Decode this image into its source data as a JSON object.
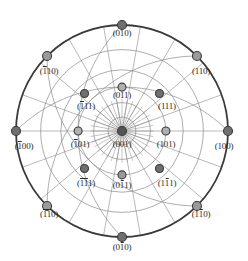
{
  "figure": {
    "type": "stereographic-projection",
    "center_pole": "(001)",
    "primitive_circle_color": "#3a3a3a",
    "net_line_color": "#8a8a8a",
    "pole_outline_color": "#3a3a3a",
    "background_color": "#ffffff",
    "text_color": "#2b2b2b"
  },
  "geometry": {
    "center_x": 122,
    "center_y": 131,
    "radius": 106,
    "net_meridians": 18,
    "net_parallels": 5
  },
  "poles": [
    {
      "id": "010",
      "label_parts": [
        {
          "t": "(0",
          "bar": false
        },
        {
          "t": "1",
          "bar": false
        },
        {
          "t": "0)",
          "bar": false
        }
      ],
      "label_text": "(010)",
      "angle_deg": 90,
      "rho_frac": 1.0,
      "fill": "#6f6f6f",
      "label_x": 122,
      "label_y": 28,
      "size": 9
    },
    {
      "id": "0-10",
      "label_parts": [
        {
          "t": "(0",
          "bar": false
        },
        {
          "t": "1",
          "bar": true
        },
        {
          "t": "0)",
          "bar": false
        }
      ],
      "label_text": "(010)",
      "angle_deg": 270,
      "rho_frac": 1.0,
      "fill": "#6f6f6f",
      "label_x": 122,
      "label_y": 242,
      "size": 9
    },
    {
      "id": "100",
      "label_parts": [
        {
          "t": "(100)",
          "bar": false
        }
      ],
      "label_text": "(100)",
      "angle_deg": 0,
      "rho_frac": 1.0,
      "fill": "#6f6f6f",
      "label_x": 224,
      "label_y": 141,
      "size": 9
    },
    {
      "id": "-100",
      "label_parts": [
        {
          "t": "(",
          "bar": false
        },
        {
          "t": "1",
          "bar": true
        },
        {
          "t": "00)",
          "bar": false
        }
      ],
      "label_text": "(100)",
      "angle_deg": 180,
      "rho_frac": 1.0,
      "fill": "#6f6f6f",
      "label_x": 24,
      "label_y": 141,
      "size": 9
    },
    {
      "id": "110",
      "label_parts": [
        {
          "t": "(110)",
          "bar": false
        }
      ],
      "label_text": "(110)",
      "angle_deg": 45,
      "rho_frac": 1.0,
      "fill": "#9a9a9a",
      "label_x": 201,
      "label_y": 66,
      "size": 9
    },
    {
      "id": "-110",
      "label_parts": [
        {
          "t": "(",
          "bar": false
        },
        {
          "t": "1",
          "bar": true
        },
        {
          "t": "10)",
          "bar": false
        }
      ],
      "label_text": "(110)",
      "angle_deg": 135,
      "rho_frac": 1.0,
      "fill": "#9a9a9a",
      "label_x": 49,
      "label_y": 66,
      "size": 9
    },
    {
      "id": "-1-10",
      "label_parts": [
        {
          "t": "(",
          "bar": false
        },
        {
          "t": "11",
          "bar": true
        },
        {
          "t": "0)",
          "bar": false
        }
      ],
      "label_text": "(110)",
      "angle_deg": 225,
      "rho_frac": 1.0,
      "fill": "#9a9a9a",
      "label_x": 49,
      "label_y": 209,
      "size": 9
    },
    {
      "id": "1-10",
      "label_parts": [
        {
          "t": "(1",
          "bar": false
        },
        {
          "t": "1",
          "bar": true
        },
        {
          "t": "0)",
          "bar": false
        }
      ],
      "label_text": "(110)",
      "angle_deg": 315,
      "rho_frac": 1.0,
      "fill": "#9a9a9a",
      "label_x": 201,
      "label_y": 209,
      "size": 9
    },
    {
      "id": "001",
      "label_parts": [
        {
          "t": "(001)",
          "bar": false
        }
      ],
      "label_text": "(001)",
      "angle_deg": 0,
      "rho_frac": 0.0,
      "fill": "#555555",
      "label_x": 122,
      "label_y": 139,
      "size": 9
    },
    {
      "id": "011",
      "label_parts": [
        {
          "t": "(011)",
          "bar": false
        }
      ],
      "label_text": "(011)",
      "angle_deg": 90,
      "rho_frac": 0.414,
      "fill": "#b0b0b0",
      "label_x": 122,
      "label_y": 90,
      "size": 8
    },
    {
      "id": "0-11",
      "label_parts": [
        {
          "t": "(0",
          "bar": false
        },
        {
          "t": "1",
          "bar": true
        },
        {
          "t": "1)",
          "bar": false
        }
      ],
      "label_text": "(011)",
      "angle_deg": 270,
      "rho_frac": 0.414,
      "fill": "#9a9a9a",
      "label_x": 122,
      "label_y": 180,
      "size": 8
    },
    {
      "id": "101",
      "label_parts": [
        {
          "t": "(101)",
          "bar": false
        }
      ],
      "label_text": "(101)",
      "angle_deg": 0,
      "rho_frac": 0.414,
      "fill": "#b0b0b0",
      "label_x": 166,
      "label_y": 139,
      "size": 8
    },
    {
      "id": "-101",
      "label_parts": [
        {
          "t": "(",
          "bar": false
        },
        {
          "t": "1",
          "bar": true
        },
        {
          "t": "01)",
          "bar": false
        }
      ],
      "label_text": "(101)",
      "angle_deg": 180,
      "rho_frac": 0.414,
      "fill": "#b0b0b0",
      "label_x": 80,
      "label_y": 139,
      "size": 8
    },
    {
      "id": "111",
      "label_parts": [
        {
          "t": "(111)",
          "bar": false
        }
      ],
      "label_text": "(111)",
      "angle_deg": 45,
      "rho_frac": 0.5,
      "fill": "#6f6f6f",
      "label_x": 167,
      "label_y": 101,
      "size": 8
    },
    {
      "id": "-111",
      "label_parts": [
        {
          "t": "(",
          "bar": false
        },
        {
          "t": "1",
          "bar": true
        },
        {
          "t": "11)",
          "bar": false
        }
      ],
      "label_text": "(111)",
      "angle_deg": 135,
      "rho_frac": 0.5,
      "fill": "#6f6f6f",
      "label_x": 86,
      "label_y": 101,
      "size": 8
    },
    {
      "id": "-1-11",
      "label_parts": [
        {
          "t": "(",
          "bar": false
        },
        {
          "t": "11",
          "bar": true
        },
        {
          "t": "1)",
          "bar": false
        }
      ],
      "label_text": "(111)",
      "angle_deg": 225,
      "rho_frac": 0.5,
      "fill": "#6f6f6f",
      "label_x": 86,
      "label_y": 178,
      "size": 8
    },
    {
      "id": "1-11",
      "label_parts": [
        {
          "t": "(1",
          "bar": false
        },
        {
          "t": "1",
          "bar": true
        },
        {
          "t": "1)",
          "bar": false
        }
      ],
      "label_text": "(111)",
      "angle_deg": 315,
      "rho_frac": 0.5,
      "fill": "#6f6f6f",
      "label_x": 167,
      "label_y": 178,
      "size": 8
    }
  ]
}
